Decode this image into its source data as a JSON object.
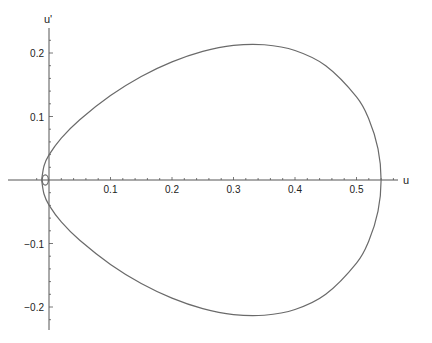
{
  "chart_data": {
    "type": "line",
    "title": "",
    "xlabel": "u",
    "ylabel": "u'",
    "xlim": [
      -0.015,
      0.57
    ],
    "ylim": [
      -0.235,
      0.235
    ],
    "grid": false,
    "legend": "none",
    "x_ticks": [
      {
        "value": 0.1,
        "label": "0.1"
      },
      {
        "value": 0.2,
        "label": "0.2"
      },
      {
        "value": 0.3,
        "label": "0.3"
      },
      {
        "value": 0.4,
        "label": "0.4"
      },
      {
        "value": 0.5,
        "label": "0.5"
      }
    ],
    "y_ticks": [
      {
        "value": 0.2,
        "label": "0.2"
      },
      {
        "value": 0.1,
        "label": "0.1"
      },
      {
        "value": -0.1,
        "label": "−0.1"
      },
      {
        "value": -0.2,
        "label": "−0.2"
      }
    ],
    "series": [
      {
        "name": "outer-orbit",
        "closed": true,
        "symmetric_about_u_axis": true,
        "upper_branch": [
          [
            -0.012,
            0.0
          ],
          [
            -0.008,
            0.0225
          ],
          [
            0.0,
            0.0395
          ],
          [
            0.02,
            0.066
          ],
          [
            0.05,
            0.095
          ],
          [
            0.1,
            0.133
          ],
          [
            0.15,
            0.163
          ],
          [
            0.2,
            0.186
          ],
          [
            0.25,
            0.2026
          ],
          [
            0.3,
            0.212
          ],
          [
            0.35,
            0.213
          ],
          [
            0.4,
            0.204
          ],
          [
            0.45,
            0.18
          ],
          [
            0.5,
            0.131
          ],
          [
            0.52,
            0.096
          ],
          [
            0.535,
            0.049
          ],
          [
            0.54,
            0.0
          ]
        ]
      },
      {
        "name": "inner-orbit",
        "closed": true,
        "ellipse": {
          "center": [
            -0.006,
            0.0
          ],
          "u_radius": 0.005,
          "up_radius": 0.008
        }
      }
    ]
  }
}
